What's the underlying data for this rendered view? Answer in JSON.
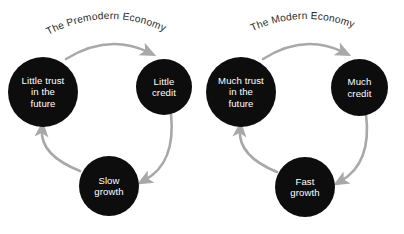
{
  "diagram": {
    "title_left": "The Premodern Economy",
    "title_right": "The Modern Economy",
    "colors": {
      "background": "#ffffff",
      "node_fill": "#0d0d0d",
      "node_text": "#ffffff",
      "arrow": "#a8a8a8",
      "title_text": "#2a2a2a"
    },
    "cycles": [
      {
        "name": "premodern-economy",
        "title": "The Premodern Economy",
        "nodes": [
          {
            "id": "little-trust",
            "label": "Little trust\nin the\nfuture"
          },
          {
            "id": "little-credit",
            "label": "Little\ncredit"
          },
          {
            "id": "slow-growth",
            "label": "Slow\ngrowth"
          }
        ],
        "edges": [
          {
            "from": "little-trust",
            "to": "little-credit"
          },
          {
            "from": "little-credit",
            "to": "slow-growth"
          },
          {
            "from": "slow-growth",
            "to": "little-trust"
          }
        ]
      },
      {
        "name": "modern-economy",
        "title": "The Modern Economy",
        "nodes": [
          {
            "id": "much-trust",
            "label": "Much trust\nin the\nfuture"
          },
          {
            "id": "much-credit",
            "label": "Much\ncredit"
          },
          {
            "id": "fast-growth",
            "label": "Fast\ngrowth"
          }
        ],
        "edges": [
          {
            "from": "much-trust",
            "to": "much-credit"
          },
          {
            "from": "much-credit",
            "to": "fast-growth"
          },
          {
            "from": "fast-growth",
            "to": "much-trust"
          }
        ]
      }
    ]
  }
}
